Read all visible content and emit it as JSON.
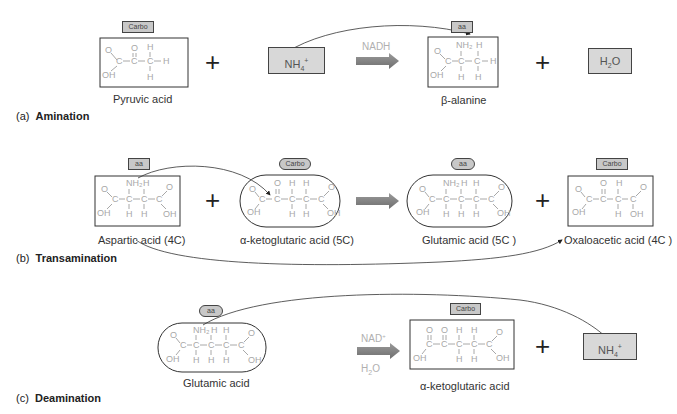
{
  "sections": {
    "a": {
      "letter": "(a)",
      "title": "Amination",
      "reactant1": {
        "tag": "Carbo",
        "name": "Pyruvic acid"
      },
      "reactant2": {
        "formula": "NH4+"
      },
      "condition": "NADH",
      "product1": {
        "tag": "aa",
        "name": "β-alanine"
      },
      "product2": {
        "formula": "H2O"
      }
    },
    "b": {
      "letter": "(b)",
      "title": "Transamination",
      "reactant1": {
        "tag": "aa",
        "name": "Aspartic acid (4C)"
      },
      "reactant2": {
        "tag": "Carbo",
        "name": "α-ketoglutaric acid (5C)"
      },
      "product1": {
        "tag": "aa",
        "name": "Glutamic acid (5C )"
      },
      "product2": {
        "tag": "Carbo",
        "name": "Oxaloacetic acid (4C )"
      }
    },
    "c": {
      "letter": "(c)",
      "title": "Deamination",
      "reactant1": {
        "tag": "aa",
        "name": "Glutamic acid"
      },
      "condition_top": "NAD+",
      "condition_bottom": "H2O",
      "product1": {
        "tag": "Carbo",
        "name": "α-ketoglutaric acid"
      },
      "product2": {
        "formula": "NH4+"
      }
    }
  },
  "symbols": {
    "plus": "+"
  },
  "colors": {
    "tag_fill": "#c8c8c8",
    "box_fill": "#d8d8d8",
    "arrow": "#888888",
    "structure": "#a8a8a8"
  }
}
